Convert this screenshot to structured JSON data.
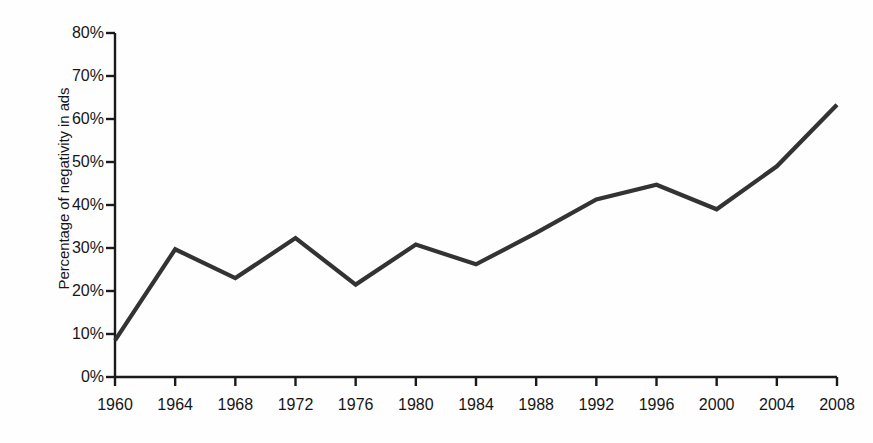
{
  "chart_data": {
    "type": "line",
    "title": "",
    "xlabel": "",
    "ylabel": "Percentage of negativity in ads",
    "categories": [
      "1960",
      "1964",
      "1968",
      "1972",
      "1976",
      "1980",
      "1984",
      "1988",
      "1992",
      "1996",
      "2000",
      "2004",
      "2008"
    ],
    "x": [
      1960,
      1964,
      1968,
      1972,
      1976,
      1980,
      1984,
      1988,
      1992,
      1996,
      2000,
      2004,
      2008
    ],
    "values": [
      8.5,
      29.7,
      23.0,
      32.3,
      21.5,
      30.8,
      26.2,
      33.5,
      41.3,
      44.7,
      39.0,
      49.0,
      63.3
    ],
    "series": [
      {
        "name": "Percentage of negativity in ads",
        "values": [
          8.5,
          29.7,
          23.0,
          32.3,
          21.5,
          30.8,
          26.2,
          33.5,
          41.3,
          44.7,
          39.0,
          49.0,
          63.3
        ]
      }
    ],
    "ylim": [
      0,
      80
    ],
    "xlim": [
      1960,
      2008
    ],
    "y_ticks": [
      0,
      10,
      20,
      30,
      40,
      50,
      60,
      70,
      80
    ],
    "y_tick_labels": [
      "0%",
      "10%",
      "20%",
      "30%",
      "40%",
      "50%",
      "60%",
      "70%",
      "80%"
    ],
    "grid": false,
    "legend": false,
    "legend_position": "none",
    "line_color": "#333333",
    "axis_color": "#1a1a1a",
    "background_color": "#fefefe"
  }
}
